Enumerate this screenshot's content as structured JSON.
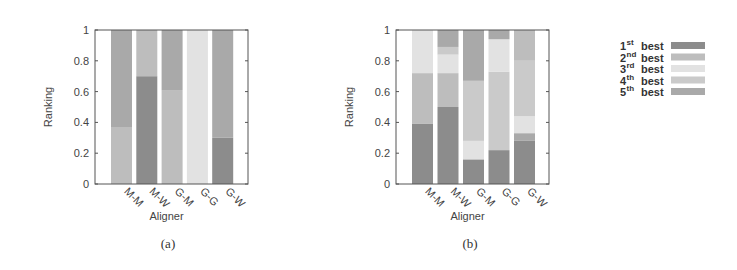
{
  "chart_data": [
    {
      "type": "bar",
      "stacked": true,
      "id": "a",
      "caption": "(a)",
      "xlabel": "Aligner",
      "ylabel": "Ranking",
      "ylim": [
        0,
        1
      ],
      "yticks": [
        "0",
        "0.2",
        "0.4",
        "0.6",
        "0.8",
        "1"
      ],
      "grid": false,
      "categories": [
        "M-M",
        "M-W",
        "G-M",
        "G-G",
        "G-W"
      ],
      "bars": [
        {
          "category": "M-M",
          "segments": [
            {
              "rank": "2nd best",
              "value": 0.37
            },
            {
              "rank": "5th best",
              "value": 0.63
            }
          ]
        },
        {
          "category": "M-W",
          "segments": [
            {
              "rank": "1st best",
              "value": 0.7
            },
            {
              "rank": "2nd best",
              "value": 0.3
            }
          ]
        },
        {
          "category": "G-M",
          "segments": [
            {
              "rank": "2nd best",
              "value": 0.61
            },
            {
              "rank": "5th best",
              "value": 0.39
            }
          ]
        },
        {
          "category": "G-G",
          "segments": [
            {
              "rank": "3rd best",
              "value": 1.0
            }
          ]
        },
        {
          "category": "G-W",
          "segments": [
            {
              "rank": "1st best",
              "value": 0.3
            },
            {
              "rank": "5th best",
              "value": 0.7
            }
          ]
        }
      ]
    },
    {
      "type": "bar",
      "stacked": true,
      "id": "b",
      "caption": "(b)",
      "xlabel": "Aligner",
      "ylabel": "Ranking",
      "ylim": [
        0,
        1
      ],
      "yticks": [
        "0",
        "0.2",
        "0.4",
        "0.6",
        "0.8",
        "1"
      ],
      "grid": false,
      "categories": [
        "M-M",
        "M-W",
        "G-M",
        "G-G",
        "G-W"
      ],
      "bars": [
        {
          "category": "M-M",
          "segments": [
            {
              "rank": "1st best",
              "value": 0.39
            },
            {
              "rank": "2nd best",
              "value": 0.33
            },
            {
              "rank": "3rd best",
              "value": 0.28
            }
          ]
        },
        {
          "category": "M-W",
          "segments": [
            {
              "rank": "1st best",
              "value": 0.5
            },
            {
              "rank": "2nd best",
              "value": 0.22
            },
            {
              "rank": "3rd best",
              "value": 0.12
            },
            {
              "rank": "4th best",
              "value": 0.05
            },
            {
              "rank": "5th best",
              "value": 0.11
            }
          ]
        },
        {
          "category": "G-M",
          "segments": [
            {
              "rank": "1st best",
              "value": 0.16
            },
            {
              "rank": "3rd best",
              "value": 0.12
            },
            {
              "rank": "4th best",
              "value": 0.39
            },
            {
              "rank": "5th best",
              "value": 0.33
            }
          ]
        },
        {
          "category": "G-G",
          "segments": [
            {
              "rank": "1st best",
              "value": 0.22
            },
            {
              "rank": "4th best",
              "value": 0.51
            },
            {
              "rank": "3rd best",
              "value": 0.21
            },
            {
              "rank": "5th best",
              "value": 0.06
            }
          ]
        },
        {
          "category": "G-W",
          "segments": [
            {
              "rank": "1st best",
              "value": 0.28
            },
            {
              "rank": "5th best",
              "value": 0.05
            },
            {
              "rank": "3rd best",
              "value": 0.11
            },
            {
              "rank": "4th best",
              "value": 0.36
            },
            {
              "rank": "2nd best",
              "value": 0.2
            }
          ]
        }
      ]
    }
  ],
  "legend": {
    "position": "right",
    "entries": [
      {
        "num": "1",
        "sup": "st",
        "word": "best",
        "label": "1st best",
        "color": "#8c8c8c"
      },
      {
        "num": "2",
        "sup": "nd",
        "word": "best",
        "label": "2nd best",
        "color": "#bdbdbd"
      },
      {
        "num": "3",
        "sup": "rd",
        "word": "best",
        "label": "3rd best",
        "color": "#e2e2e2"
      },
      {
        "num": "4",
        "sup": "th",
        "word": "best",
        "label": "4th best",
        "color": "#cacaca"
      },
      {
        "num": "5",
        "sup": "th",
        "word": "best",
        "label": "5th best",
        "color": "#a9a9a9"
      }
    ]
  },
  "colors": {
    "frame": "#555555",
    "background": "#ffffff"
  }
}
